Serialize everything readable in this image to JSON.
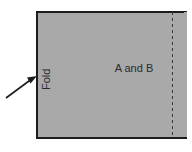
{
  "diagram": {
    "panel": {
      "name": "folded-sheet-panel",
      "fill_color": "#a9a9a9",
      "border_color": "#1c1c1c",
      "x": 36,
      "y": 11,
      "width": 150,
      "height": 127
    },
    "labels": {
      "fold": "Fold",
      "region": "A and B"
    },
    "fold_label": {
      "text": "Fold",
      "rotation_deg": -90,
      "x": 50,
      "y": 90,
      "font_size": 11,
      "color": "#2b2b2b"
    },
    "region_label": {
      "text": "A and B",
      "x": 134,
      "y": 72,
      "font_size": 11,
      "color": "#2b2b2b"
    },
    "arrow": {
      "name": "fold-arrow",
      "color": "#1c1c1c",
      "tail_x": 6,
      "tail_y": 98,
      "tip_x": 37,
      "tip_y": 76
    },
    "dashed_line": {
      "name": "right-dashed-fold-line",
      "color": "#3a3a3a",
      "x": 172,
      "y_start": 12,
      "y_end": 137,
      "dash_pattern": "3,3",
      "stroke_width": 1
    }
  }
}
